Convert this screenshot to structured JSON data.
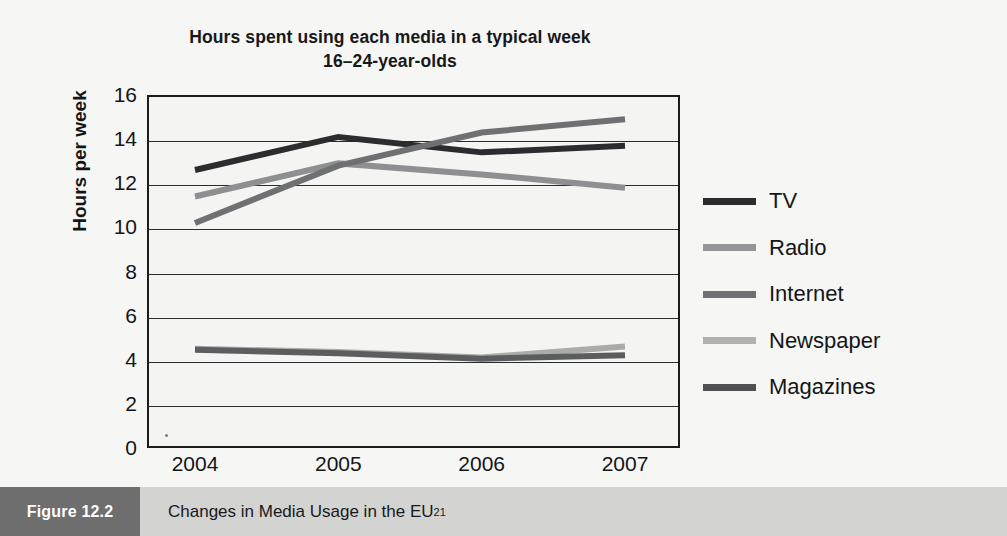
{
  "title": {
    "line1": "Hours spent using each media in a typical week",
    "line2": "16–24-year-olds"
  },
  "caption": {
    "figure_tag": "Figure 12.2",
    "text": "Changes in Media Usage in the EU",
    "superscript": "21"
  },
  "chart_data": {
    "type": "line",
    "title": "Hours spent using each media in a typical week 16–24-year-olds",
    "xlabel": "",
    "ylabel": "Hours per week",
    "categories": [
      "2004",
      "2005",
      "2006",
      "2007"
    ],
    "x_tick_labels": [
      "2004",
      "2005",
      "2006",
      "2007"
    ],
    "y_tick_labels": [
      "0",
      "2",
      "4",
      "6",
      "8",
      "10",
      "12",
      "14",
      "16"
    ],
    "y_ticks": [
      0,
      2,
      4,
      6,
      8,
      10,
      12,
      14,
      16
    ],
    "ylim": [
      0,
      16
    ],
    "grid": "horizontal",
    "legend_position": "right",
    "series": [
      {
        "name": "TV",
        "values": [
          12.6,
          14.1,
          13.4,
          13.7
        ],
        "color": "#2b2c2e"
      },
      {
        "name": "Radio",
        "values": [
          11.4,
          12.9,
          12.4,
          11.8
        ],
        "color": "#8e8f90"
      },
      {
        "name": "Internet",
        "values": [
          10.2,
          12.8,
          14.3,
          14.9
        ],
        "color": "#6f7072"
      },
      {
        "name": "Newspaper",
        "values": [
          4.5,
          4.35,
          4.1,
          4.6
        ],
        "color": "#aaabab"
      },
      {
        "name": "Magazines",
        "values": [
          4.45,
          4.3,
          4.05,
          4.2
        ],
        "color": "#5c5d5f"
      }
    ]
  },
  "legend": {
    "items": [
      {
        "label": "TV",
        "color": "#2b2c2e"
      },
      {
        "label": "Radio",
        "color": "#949596"
      },
      {
        "label": "Internet",
        "color": "#6f7072"
      },
      {
        "label": "Newspaper",
        "color": "#b0b1b1"
      },
      {
        "label": "Magazines",
        "color": "#4f5052"
      }
    ]
  }
}
